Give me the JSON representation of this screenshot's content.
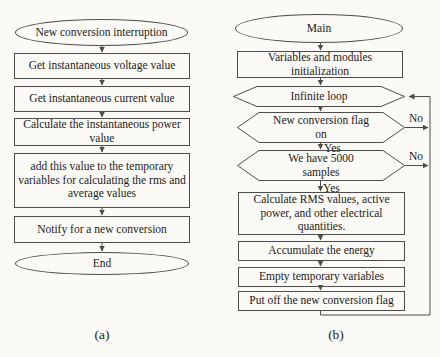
{
  "colors": {
    "line": "#4d4d4d",
    "text": "#1b1b1b",
    "background": "#fbfaf6"
  },
  "flowchart_a": {
    "caption": "(a)",
    "nodes": {
      "start": "New conversion interruption",
      "get_voltage": "Get instantaneous voltage value",
      "get_current": "Get instantaneous current value",
      "calc_power": "Calculate the instantaneous power\nvalue",
      "add_temp": "add this value to the temporary\nvariables for calculating the rms and\naverage values",
      "notify": "Notify for a new conversion",
      "end": "End"
    }
  },
  "flowchart_b": {
    "caption": "(b)",
    "nodes": {
      "main": "Main",
      "init": "Variables  and modules\ninitialization",
      "infinite_loop": "Infinite loop",
      "new_conversion_flag": "New conversion flag\non",
      "have_samples": "We have 5000\nsamples",
      "calc_rms": "Calculate RMS values, active\npower, and other electrical\nquantities.",
      "accumulate": "Accumulate the energy",
      "empty_temp": "Empty temporary variables",
      "put_off_flag": "Put off the new conversion flag"
    },
    "edge_labels": {
      "yes_flag": "Yes",
      "yes_samples": "Yes",
      "no_flag": "No",
      "no_samples": "No"
    }
  }
}
